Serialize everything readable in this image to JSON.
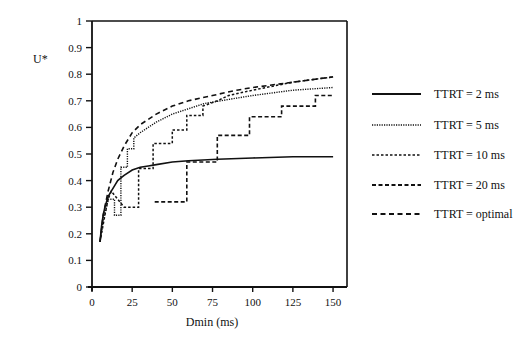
{
  "chart_data": {
    "type": "line",
    "title": "",
    "xlabel": "Dmin (ms)",
    "ylabel": "U*",
    "xlim": [
      0,
      150
    ],
    "ylim": [
      0,
      1
    ],
    "x_ticks": [
      0,
      25,
      50,
      75,
      100,
      125,
      150
    ],
    "y_ticks": [
      0,
      0.1,
      0.2,
      0.3,
      0.4,
      0.5,
      0.6,
      0.7,
      0.8,
      0.9,
      1
    ],
    "y_tick_labels": [
      "0",
      "0.1",
      "0.2",
      "0.3",
      "0.4",
      "0.5",
      "0.6",
      "0.7",
      "0.8",
      "0.9",
      "1"
    ],
    "grid": false,
    "legend_position": "right",
    "series": [
      {
        "name": "TTRT = 2 ms",
        "style": "solid",
        "x": [
          5,
          6,
          7,
          8,
          9,
          10,
          12,
          14,
          16,
          18,
          20,
          25,
          30,
          35,
          40,
          50,
          60,
          78,
          100,
          125,
          150
        ],
        "y": [
          0.17,
          0.23,
          0.27,
          0.3,
          0.32,
          0.34,
          0.36,
          0.38,
          0.4,
          0.41,
          0.42,
          0.44,
          0.45,
          0.455,
          0.46,
          0.47,
          0.475,
          0.48,
          0.485,
          0.49,
          0.49
        ]
      },
      {
        "name": "TTRT = 5 ms",
        "style": "dotted",
        "x": [
          5,
          7,
          9,
          10,
          14,
          14,
          18,
          18,
          22,
          22,
          26,
          26,
          30,
          35,
          40,
          50,
          60,
          70,
          80,
          90,
          100,
          125,
          150
        ],
        "y": [
          0.17,
          0.25,
          0.3,
          0.33,
          0.33,
          0.27,
          0.27,
          0.45,
          0.45,
          0.52,
          0.52,
          0.56,
          0.58,
          0.6,
          0.62,
          0.65,
          0.67,
          0.69,
          0.7,
          0.71,
          0.72,
          0.74,
          0.75
        ]
      },
      {
        "name": "TTRT = 10 ms",
        "style": "short-dash",
        "x": [
          5,
          8,
          10,
          12,
          20,
          20,
          29,
          29,
          38,
          38,
          50,
          50,
          59,
          59,
          69,
          69,
          78,
          85,
          100,
          125,
          150
        ],
        "y": [
          0.17,
          0.27,
          0.33,
          0.36,
          0.3,
          0.3,
          0.3,
          0.445,
          0.445,
          0.54,
          0.54,
          0.59,
          0.59,
          0.645,
          0.645,
          0.68,
          0.7,
          0.72,
          0.74,
          0.77,
          0.79
        ]
      },
      {
        "name": "TTRT = 20 ms",
        "style": "dash",
        "x": [
          39,
          59,
          59,
          78,
          78,
          98,
          98,
          118,
          118,
          139,
          139,
          150
        ],
        "y": [
          0.32,
          0.32,
          0.47,
          0.47,
          0.57,
          0.57,
          0.64,
          0.64,
          0.68,
          0.68,
          0.72,
          0.72
        ]
      },
      {
        "name": "TTRT = optimal",
        "style": "long-dash",
        "x": [
          5,
          7,
          10,
          13,
          16,
          20,
          25,
          30,
          40,
          50,
          60,
          75,
          90,
          100,
          125,
          150
        ],
        "y": [
          0.17,
          0.27,
          0.36,
          0.43,
          0.48,
          0.53,
          0.58,
          0.61,
          0.65,
          0.68,
          0.7,
          0.72,
          0.74,
          0.75,
          0.77,
          0.79
        ]
      }
    ]
  },
  "legend": {
    "items": [
      {
        "label": "TTRT = 2 ms"
      },
      {
        "label": "TTRT = 5 ms"
      },
      {
        "label": "TTRT = 10 ms"
      },
      {
        "label": "TTRT = 20 ms"
      },
      {
        "label": "TTRT = optimal"
      }
    ]
  },
  "axes": {
    "x_title": "Dmin (ms)",
    "y_title": "U*",
    "x_tick_labels": [
      "0",
      "25",
      "50",
      "75",
      "100",
      "125",
      "150"
    ],
    "y_tick_labels": [
      "0",
      "0.1",
      "0.2",
      "0.3",
      "0.4",
      "0.5",
      "0.6",
      "0.7",
      "0.8",
      "0.9",
      "1"
    ]
  }
}
